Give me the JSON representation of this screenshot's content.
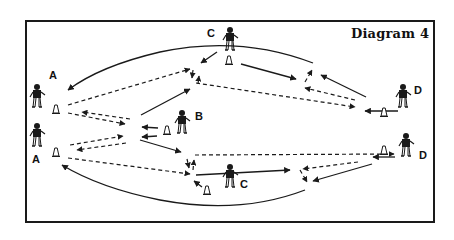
{
  "diagram": {
    "title": "Diagram 4",
    "labels": {
      "a_top": "A",
      "a_bottom": "A",
      "b": "B",
      "c_top": "C",
      "c_bottom": "C",
      "d_top": "D",
      "d_bottom": "D"
    },
    "players": [
      {
        "id": "A1",
        "label": "A",
        "x": 37,
        "y": 97
      },
      {
        "id": "A2",
        "label": "A",
        "x": 37,
        "y": 135
      },
      {
        "id": "B",
        "label": "B",
        "x": 182,
        "y": 122
      },
      {
        "id": "C1",
        "label": "C",
        "x": 230,
        "y": 42
      },
      {
        "id": "C2",
        "label": "C",
        "x": 230,
        "y": 178
      },
      {
        "id": "D1",
        "label": "D",
        "x": 402,
        "y": 97
      },
      {
        "id": "D2",
        "label": "D",
        "x": 407,
        "y": 145
      }
    ],
    "cones": [
      {
        "x": 56,
        "y": 109
      },
      {
        "x": 56,
        "y": 152
      },
      {
        "x": 167,
        "y": 130
      },
      {
        "x": 229,
        "y": 60
      },
      {
        "x": 382,
        "y": 111
      },
      {
        "x": 385,
        "y": 150
      },
      {
        "x": 207,
        "y": 190
      }
    ],
    "legend": {
      "solid_line": "player run",
      "dashed_line": "ball pass"
    },
    "colors": {
      "ink": "#1a1a1a",
      "background": "#ffffff"
    }
  }
}
